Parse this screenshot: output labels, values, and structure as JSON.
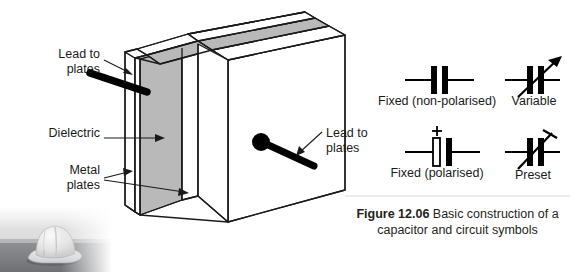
{
  "figure": {
    "number": "Figure 12.06",
    "caption_text": " Basic construction of a capacitor and circuit symbols"
  },
  "diagram": {
    "labels": {
      "lead_left": "Lead to\nplates",
      "dielectric": "Dielectric",
      "metal_plates": "Metal\nplates",
      "lead_right": "Lead to\nplates"
    },
    "colors": {
      "dielectric_fill": "#b9b9b9",
      "plate_fill": "#ffffff",
      "outline": "#1a1a1a",
      "lead": "#000000",
      "top_face_fill": "#b9b9b9"
    }
  },
  "symbols": [
    {
      "id": "fixed-non-polarised",
      "label": "Fixed (non-polarised)",
      "left_plate": "solid",
      "right_plate": "solid",
      "marker": "none"
    },
    {
      "id": "variable",
      "label": "Variable",
      "left_plate": "solid",
      "right_plate": "solid",
      "marker": "arrow"
    },
    {
      "id": "fixed-polarised",
      "label": "Fixed (polarised)",
      "left_plate": "hollow",
      "right_plate": "solid",
      "marker": "plus",
      "plus_sign": "+"
    },
    {
      "id": "preset",
      "label": "Preset",
      "left_plate": "solid",
      "right_plate": "solid",
      "marker": "preset-tee"
    }
  ],
  "photo": {
    "name": "hard-hat-photo-fragment",
    "description": "grayscale hard hat on a ledge, fading to white"
  }
}
